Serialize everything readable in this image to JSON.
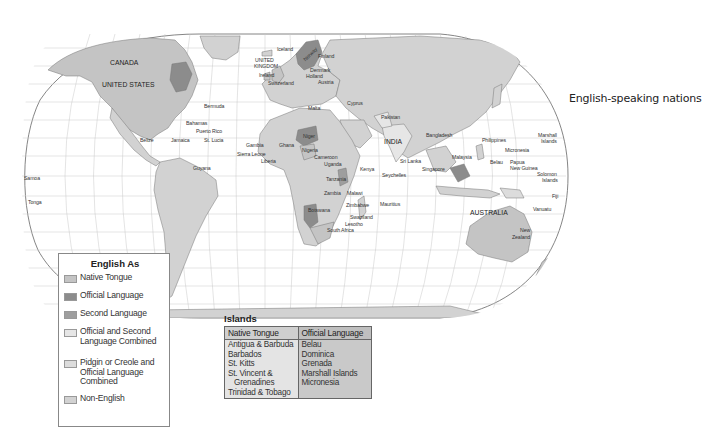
{
  "caption": "English-speaking nations",
  "colors": {
    "ocean": "#ffffff",
    "grid": "#bdbdbd",
    "native_tongue": "#c4c4c4",
    "official_language": "#8c8c8c",
    "second_language": "#9e9e9e",
    "official_and_second": "#e6e6e6",
    "pidgin_creole": "#dcdcdc",
    "non_english": "#d2d2d2"
  },
  "legend": {
    "title": "English As",
    "items": [
      {
        "label": "Native Tongue",
        "color": "#c4c4c4"
      },
      {
        "label": "Official Language",
        "color": "#8c8c8c"
      },
      {
        "label": "Second Language",
        "color": "#9e9e9e"
      },
      {
        "label": "Official and Second Language Combined",
        "line1": "Official and Second",
        "line2": "Language Combined",
        "color": "#e6e6e6"
      },
      {
        "label": "Pidgin or Creole and Official Language Combined",
        "line1": "Pidgin or Creole and",
        "line2": "Official Language",
        "line3": "Combined",
        "color": "#dcdcdc"
      },
      {
        "label": "Non-English",
        "color": "#d2d2d2"
      }
    ]
  },
  "islands": {
    "title": "Islands",
    "columns": [
      {
        "header": "Native Tongue",
        "rows": [
          "Antigua & Barbuda",
          "Barbados",
          "St. Kitts",
          "St. Vincent &",
          "Grenadines",
          "Trinidad & Tobago"
        ]
      },
      {
        "header": "Official Language",
        "rows": [
          "Belau",
          "Dominica",
          "Grenada",
          "Marshall Islands",
          "Micronesia"
        ]
      }
    ]
  },
  "map_labels": {
    "canada": "CANADA",
    "united_states": "UNITED STATES",
    "bermuda": "Bermuda",
    "bahamas": "Bahamas",
    "puerto_rico": "Puerto Rico",
    "belize": "Belize",
    "jamaica": "Jamaica",
    "st_lucia": "St. Lucia",
    "guyana": "Guyana",
    "samoa": "Samoa",
    "tonga": "Tonga",
    "iceland": "Iceland",
    "united_kingdom_1": "UNITED",
    "united_kingdom_2": "KINGDOM",
    "ireland": "Ireland",
    "switzerland": "Switzerland",
    "norway": "Norway",
    "finland": "Finland",
    "denmark": "Denmark",
    "holland": "Holland",
    "austria": "Austria",
    "malta": "Malta",
    "cyprus": "Cyprus",
    "pakistan": "Pakistan",
    "india": "INDIA",
    "bangladesh": "Bangladesh",
    "sri_lanka": "Sri Lanka",
    "singapore": "Singapore",
    "malaysia": "Malaysia",
    "philippines": "Philippines",
    "micronesia": "Micronesia",
    "marshall_islands_1": "Marshall",
    "marshall_islands_2": "Islands",
    "belau": "Belau",
    "papua_new_guinea_1": "Papua",
    "papua_new_guinea_2": "New Guinea",
    "solomon_islands_1": "Solomon",
    "solomon_islands_2": "Islands",
    "fiji": "Fiji",
    "vanuatu": "Vanuatu",
    "australia": "AUSTRALIA",
    "new_zealand_1": "New",
    "new_zealand_2": "Zealand",
    "niger": "Niger",
    "gambia": "Gambia",
    "ghana": "Ghana",
    "nigeria": "Nigeria",
    "sierra_leone": "Sierra Leone",
    "liberia": "Liberia",
    "cameroon": "Cameroon",
    "uganda": "Uganda",
    "kenya": "Kenya",
    "seychelles": "Seychelles",
    "tanzania": "Tanzania",
    "zambia": "Zambia",
    "malawi": "Malawi",
    "zimbabwe": "Zimbabwe",
    "mauritius": "Mauritius",
    "botswana": "Botswana",
    "swaziland": "Swaziland",
    "lesotho": "Lesotho",
    "south_africa": "South Africa"
  }
}
